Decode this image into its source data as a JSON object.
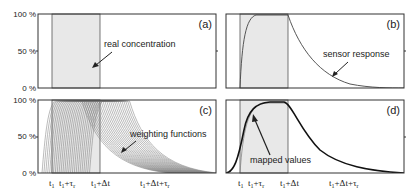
{
  "chart_data": [
    {
      "panel": "(a)",
      "type": "area",
      "title": "",
      "annotation": "real concentration",
      "ylabel_ticks": [
        "100 %",
        "50 %",
        "0 %"
      ],
      "ylim": [
        0,
        100
      ],
      "series": [
        {
          "name": "real concentration",
          "shape": "rectangular pulse",
          "start": "t1",
          "end": "t1+Δt",
          "value": 100
        }
      ]
    },
    {
      "panel": "(b)",
      "type": "line",
      "annotation": "sensor response",
      "ylim": [
        0,
        100
      ],
      "series": [
        {
          "name": "sensor response",
          "shape": "exponential rise from t1 to 100%, exponential decay after t1+Δt"
        }
      ]
    },
    {
      "panel": "(c)",
      "type": "line",
      "annotation": "weighting functions",
      "ylabel_ticks": [
        "100 %",
        "50 %",
        "0 %"
      ],
      "ylim": [
        0,
        100
      ],
      "series": [
        {
          "name": "weighting functions",
          "shape": "family of shifted sensor-response curves"
        }
      ]
    },
    {
      "panel": "(d)",
      "type": "line",
      "annotation": "mapped values",
      "ylim": [
        0,
        100
      ],
      "series": [
        {
          "name": "mapped values",
          "shape": "smooth sigmoid rise, plateau, decay"
        }
      ]
    }
  ],
  "labels": {
    "y100": "100 %",
    "y50": "50 %",
    "y0": "0 %",
    "pa": "(a)",
    "pb": "(b)",
    "pc": "(c)",
    "pd": "(d)",
    "ann_a": "real concentration",
    "ann_b": "sensor response",
    "ann_c": "weighting functions",
    "ann_d": "mapped values",
    "x_t1": "t",
    "x_t1_tau": "t",
    "x_t1_dt": "t",
    "x_t1_dt_tau": "t"
  }
}
